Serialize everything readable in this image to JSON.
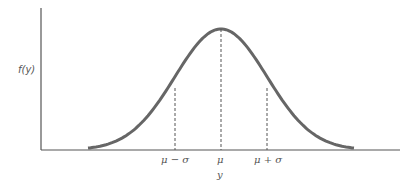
{
  "chart_data": {
    "type": "line",
    "title": "",
    "xlabel": "y",
    "ylabel": "f(y)",
    "x_tick_labels": [
      "μ − σ",
      "μ",
      "μ + σ"
    ],
    "grid": false,
    "legend": null,
    "reference_lines": [
      {
        "at": "μ − σ",
        "style": "dashed"
      },
      {
        "at": "μ",
        "style": "dashed"
      },
      {
        "at": "μ + σ",
        "style": "dashed"
      }
    ],
    "series": [
      {
        "name": "f(y)",
        "x_in_sigma": [
          -3,
          -2.5,
          -2,
          -1.5,
          -1,
          -0.5,
          0,
          0.5,
          1,
          1.5,
          2,
          2.5,
          3
        ],
        "values": [
          0.004,
          0.018,
          0.054,
          0.13,
          0.242,
          0.352,
          0.399,
          0.352,
          0.242,
          0.13,
          0.054,
          0.018,
          0.004
        ]
      }
    ]
  },
  "labels": {
    "ylabel": "f(y)",
    "xlabel": "y",
    "tick_minus": "μ − σ",
    "tick_mu": "μ",
    "tick_plus": "μ + σ"
  },
  "colors": {
    "axis": "#555555",
    "curve": "#666666"
  }
}
